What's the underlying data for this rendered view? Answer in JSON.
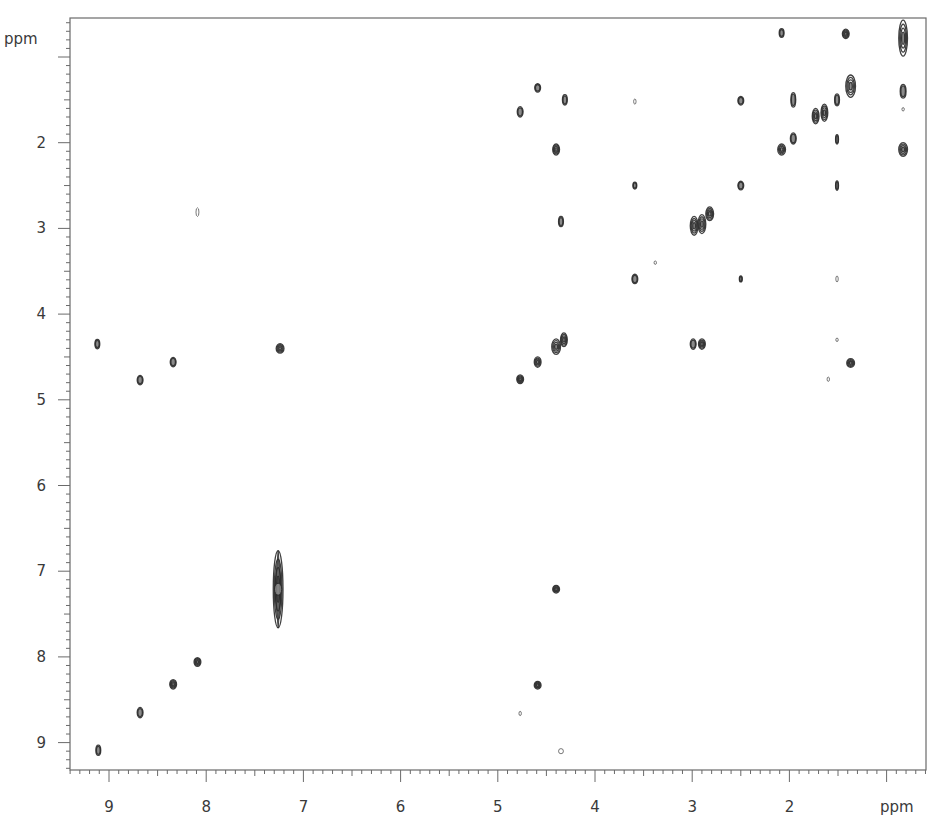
{
  "chart_data": {
    "type": "scatter",
    "subtype": "2D NMR contour plot (homonuclear correlation)",
    "title": "",
    "xlabel": "ppm",
    "ylabel": "ppm",
    "x_axis": {
      "label": "ppm",
      "range": [
        9.4,
        0.55
      ],
      "reversed": true,
      "ticks": [
        9,
        8,
        7,
        6,
        5,
        4,
        3,
        2
      ],
      "unlabeled_major_ticks": [
        1
      ],
      "minor_step": 0.1
    },
    "y_axis": {
      "label": "ppm",
      "range": [
        0.55,
        9.3
      ],
      "reversed": true,
      "ticks": [
        2,
        3,
        4,
        5,
        6,
        7,
        8,
        9
      ],
      "unlabeled_major_ticks": [
        1
      ],
      "minor_step": 0.1
    },
    "grid": false,
    "legend": null,
    "contour_color": "#2b2b2b",
    "peaks": [
      {
        "x": 9.11,
        "y": 9.09,
        "w": 0.05,
        "h": 0.12,
        "type": "diagonal"
      },
      {
        "x": 8.68,
        "y": 8.65,
        "w": 0.06,
        "h": 0.12,
        "type": "diagonal"
      },
      {
        "x": 8.34,
        "y": 8.32,
        "w": 0.07,
        "h": 0.11,
        "type": "diagonal"
      },
      {
        "x": 8.09,
        "y": 8.06,
        "w": 0.07,
        "h": 0.1,
        "type": "diagonal"
      },
      {
        "x": 7.26,
        "y": 7.21,
        "w": 0.1,
        "h": 0.9,
        "type": "diagonal"
      },
      {
        "x": 9.12,
        "y": 4.35,
        "w": 0.05,
        "h": 0.11,
        "type": "cross"
      },
      {
        "x": 8.68,
        "y": 4.77,
        "w": 0.06,
        "h": 0.11,
        "type": "cross"
      },
      {
        "x": 8.34,
        "y": 4.56,
        "w": 0.06,
        "h": 0.11,
        "type": "cross"
      },
      {
        "x": 7.24,
        "y": 4.4,
        "w": 0.08,
        "h": 0.11,
        "type": "cross"
      },
      {
        "x": 8.09,
        "y": 2.81,
        "w": 0.03,
        "h": 0.1,
        "type": "cross-weak"
      },
      {
        "x": 4.77,
        "y": 4.76,
        "w": 0.07,
        "h": 0.1,
        "type": "diagonal"
      },
      {
        "x": 4.59,
        "y": 4.56,
        "w": 0.07,
        "h": 0.12,
        "type": "diagonal"
      },
      {
        "x": 4.4,
        "y": 4.38,
        "w": 0.09,
        "h": 0.18,
        "type": "diagonal"
      },
      {
        "x": 4.32,
        "y": 4.3,
        "w": 0.07,
        "h": 0.16,
        "type": "diagonal"
      },
      {
        "x": 4.77,
        "y": 1.64,
        "w": 0.06,
        "h": 0.12,
        "type": "cross"
      },
      {
        "x": 4.59,
        "y": 1.36,
        "w": 0.06,
        "h": 0.1,
        "type": "cross"
      },
      {
        "x": 4.31,
        "y": 1.5,
        "w": 0.05,
        "h": 0.12,
        "type": "cross"
      },
      {
        "x": 4.4,
        "y": 2.08,
        "w": 0.07,
        "h": 0.13,
        "type": "cross"
      },
      {
        "x": 4.35,
        "y": 2.92,
        "w": 0.05,
        "h": 0.12,
        "type": "cross"
      },
      {
        "x": 4.4,
        "y": 7.21,
        "w": 0.07,
        "h": 0.09,
        "type": "cross"
      },
      {
        "x": 4.59,
        "y": 8.33,
        "w": 0.07,
        "h": 0.09,
        "type": "cross"
      },
      {
        "x": 4.35,
        "y": 9.1,
        "w": 0.05,
        "h": 0.06,
        "type": "cross-weak"
      },
      {
        "x": 4.77,
        "y": 8.66,
        "w": 0.02,
        "h": 0.05,
        "type": "cross-weak"
      },
      {
        "x": 3.59,
        "y": 3.59,
        "w": 0.06,
        "h": 0.11,
        "type": "diagonal"
      },
      {
        "x": 3.59,
        "y": 2.5,
        "w": 0.04,
        "h": 0.08,
        "type": "cross"
      },
      {
        "x": 3.59,
        "y": 1.52,
        "w": 0.02,
        "h": 0.06,
        "type": "cross-weak"
      },
      {
        "x": 3.38,
        "y": 3.4,
        "w": 0.02,
        "h": 0.04,
        "type": "cross-weak"
      },
      {
        "x": 2.98,
        "y": 2.97,
        "w": 0.08,
        "h": 0.22,
        "type": "diagonal"
      },
      {
        "x": 2.9,
        "y": 2.95,
        "w": 0.08,
        "h": 0.22,
        "type": "diagonal"
      },
      {
        "x": 2.82,
        "y": 2.83,
        "w": 0.08,
        "h": 0.16,
        "type": "diagonal"
      },
      {
        "x": 2.99,
        "y": 4.35,
        "w": 0.06,
        "h": 0.12,
        "type": "cross"
      },
      {
        "x": 2.9,
        "y": 4.35,
        "w": 0.07,
        "h": 0.12,
        "type": "cross"
      },
      {
        "x": 2.5,
        "y": 2.5,
        "w": 0.06,
        "h": 0.1,
        "type": "diagonal"
      },
      {
        "x": 2.5,
        "y": 1.51,
        "w": 0.06,
        "h": 0.1,
        "type": "cross"
      },
      {
        "x": 2.5,
        "y": 3.59,
        "w": 0.03,
        "h": 0.07,
        "type": "cross"
      },
      {
        "x": 2.08,
        "y": 2.08,
        "w": 0.08,
        "h": 0.13,
        "type": "diagonal"
      },
      {
        "x": 2.08,
        "y": 0.72,
        "w": 0.05,
        "h": 0.1,
        "type": "cross"
      },
      {
        "x": 1.96,
        "y": 1.95,
        "w": 0.06,
        "h": 0.13,
        "type": "diagonal"
      },
      {
        "x": 1.96,
        "y": 1.5,
        "w": 0.05,
        "h": 0.17,
        "type": "cross"
      },
      {
        "x": 1.73,
        "y": 1.69,
        "w": 0.07,
        "h": 0.18,
        "type": "diagonal"
      },
      {
        "x": 1.64,
        "y": 1.65,
        "w": 0.07,
        "h": 0.2,
        "type": "diagonal"
      },
      {
        "x": 1.51,
        "y": 1.5,
        "w": 0.05,
        "h": 0.14,
        "type": "diagonal"
      },
      {
        "x": 1.37,
        "y": 1.34,
        "w": 0.1,
        "h": 0.26,
        "type": "diagonal"
      },
      {
        "x": 1.51,
        "y": 1.96,
        "w": 0.03,
        "h": 0.11,
        "type": "cross"
      },
      {
        "x": 1.51,
        "y": 2.5,
        "w": 0.03,
        "h": 0.11,
        "type": "cross"
      },
      {
        "x": 1.51,
        "y": 3.59,
        "w": 0.02,
        "h": 0.07,
        "type": "cross-weak"
      },
      {
        "x": 1.51,
        "y": 4.3,
        "w": 0.01,
        "h": 0.04,
        "type": "cross-weak"
      },
      {
        "x": 1.6,
        "y": 4.76,
        "w": 0.01,
        "h": 0.05,
        "type": "cross-weak"
      },
      {
        "x": 1.37,
        "y": 4.57,
        "w": 0.08,
        "h": 0.1,
        "type": "cross"
      },
      {
        "x": 1.42,
        "y": 0.73,
        "w": 0.07,
        "h": 0.11,
        "type": "cross"
      },
      {
        "x": 0.83,
        "y": 0.78,
        "w": 0.09,
        "h": 0.42,
        "type": "diagonal"
      },
      {
        "x": 0.83,
        "y": 1.4,
        "w": 0.06,
        "h": 0.16,
        "type": "cross"
      },
      {
        "x": 0.83,
        "y": 1.61,
        "w": 0.01,
        "h": 0.04,
        "type": "cross-weak"
      },
      {
        "x": 0.83,
        "y": 2.08,
        "w": 0.09,
        "h": 0.16,
        "type": "cross"
      }
    ]
  },
  "axes": {
    "y_unit_label": "ppm",
    "x_unit_label": "ppm",
    "x_tick_labels": [
      "9",
      "8",
      "7",
      "6",
      "5",
      "4",
      "3",
      "2"
    ],
    "y_tick_labels": [
      "2",
      "3",
      "4",
      "5",
      "6",
      "7",
      "8",
      "9"
    ]
  }
}
